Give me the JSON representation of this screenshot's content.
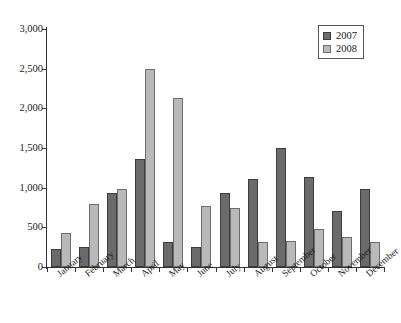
{
  "figure": {
    "title_clipped": "",
    "background_color": "#ffffff"
  },
  "legend": {
    "position": "top-right",
    "entries": [
      {
        "label": "2007",
        "color": "#6b6b6b"
      },
      {
        "label": "2008",
        "color": "#b9b9b9"
      }
    ]
  },
  "axes": {
    "y_ticks": [
      "0",
      "500",
      "1,000",
      "1,500",
      "2,000",
      "2,500",
      "3,000"
    ],
    "y_tick_values": [
      0,
      500,
      1000,
      1500,
      2000,
      2500,
      3000
    ]
  },
  "chart_data": {
    "type": "bar",
    "title": "",
    "xlabel": "",
    "ylabel": "",
    "ylim": [
      0,
      3000
    ],
    "ytick_interval": 500,
    "grid": false,
    "legend_position": "top-right",
    "categories": [
      "January",
      "February",
      "March",
      "April",
      "May",
      "June",
      "July",
      "August",
      "September",
      "October",
      "November",
      "December"
    ],
    "series": [
      {
        "name": "2007",
        "color": "#6b6b6b",
        "values": [
          230,
          255,
          935,
          1360,
          320,
          250,
          930,
          1110,
          1500,
          1140,
          705,
          985
        ]
      },
      {
        "name": "2008",
        "color": "#b9b9b9",
        "values": [
          425,
          795,
          980,
          2490,
          2135,
          775,
          745,
          320,
          330,
          485,
          375,
          320
        ]
      }
    ]
  }
}
